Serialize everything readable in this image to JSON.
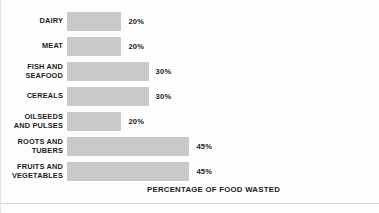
{
  "chart_data": {
    "type": "bar",
    "orientation": "horizontal",
    "title": "",
    "xlabel": "PERCENTAGE OF FOOD WASTED",
    "ylabel": "",
    "xlim": [
      0,
      50
    ],
    "grid": false,
    "legend": null,
    "unit": "%",
    "categories": [
      "DAIRY",
      "MEAT",
      "FISH AND\nSEAFOOD",
      "CEREALS",
      "OILSEEDS\nAND PULSES",
      "ROOTS AND\nTUBERS",
      "FRUITS AND\nVEGETABLES"
    ],
    "values": [
      20,
      20,
      30,
      30,
      20,
      45,
      45
    ],
    "value_labels": [
      "20%",
      "20%",
      "30%",
      "30%",
      "20%",
      "45%",
      "45%"
    ],
    "bar_color": "#c9c9c9",
    "text_color": "#1d1d1d",
    "background_color": "#fdfdfd"
  },
  "rows": [
    {
      "label": "DAIRY",
      "value": 20,
      "value_label": "20%"
    },
    {
      "label": "MEAT",
      "value": 20,
      "value_label": "20%"
    },
    {
      "label": "FISH AND\nSEAFOOD",
      "value": 30,
      "value_label": "30%"
    },
    {
      "label": "CEREALS",
      "value": 30,
      "value_label": "30%"
    },
    {
      "label": "OILSEEDS\nAND PULSES",
      "value": 20,
      "value_label": "20%"
    },
    {
      "label": "ROOTS AND\nTUBERS",
      "value": 45,
      "value_label": "45%"
    },
    {
      "label": "FRUITS AND\nVEGETABLES",
      "value": 45,
      "value_label": "45%"
    }
  ],
  "axis": {
    "title": "PERCENTAGE OF FOOD WASTED"
  }
}
